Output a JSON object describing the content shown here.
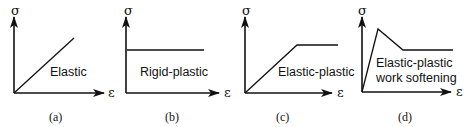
{
  "figure": {
    "axis_y_symbol": "σ",
    "axis_x_symbol": "ε",
    "panels": [
      {
        "id": "a",
        "caption": "(a)",
        "label_lines": [
          "Elastic"
        ],
        "model": "linear elastic"
      },
      {
        "id": "b",
        "caption": "(b)",
        "label_lines": [
          "Rigid-plastic"
        ],
        "model": "rigid perfectly plastic"
      },
      {
        "id": "c",
        "caption": "(c)",
        "label_lines": [
          "Elastic-plastic"
        ],
        "model": "elastic perfectly plastic"
      },
      {
        "id": "d",
        "caption": "(d)",
        "label_lines": [
          "Elastic-plastic",
          "work softening"
        ],
        "model": "elastic-plastic with work softening"
      }
    ]
  },
  "colors": {
    "line": "#111111",
    "background": "#ffffff"
  }
}
